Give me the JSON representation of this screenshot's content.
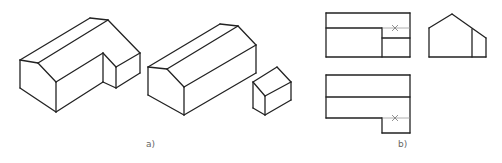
{
  "figure": {
    "background": "#ffffff",
    "line_color": "#222222",
    "hidden_line_color": "#9a9a9a",
    "labels": {
      "a": "a)",
      "b": "b)"
    },
    "part_a": {
      "caption": "a)",
      "description": "Isometric views: L-shaped gabled house, and the same house decomposed into a gabled main body plus a small gabled annex",
      "l_house": [
        [
          20,
          60,
          90,
          18
        ],
        [
          90,
          18,
          108,
          20
        ],
        [
          108,
          20,
          140,
          53
        ],
        [
          20,
          60,
          38,
          63
        ],
        [
          38,
          63,
          108,
          20
        ],
        [
          38,
          63,
          56,
          82
        ],
        [
          20,
          60,
          20,
          88
        ],
        [
          20,
          88,
          56,
          112
        ],
        [
          56,
          82,
          56,
          112
        ],
        [
          56,
          82,
          103,
          53
        ],
        [
          56,
          112,
          103,
          82
        ],
        [
          103,
          53,
          103,
          82
        ],
        [
          103,
          53,
          116,
          67
        ],
        [
          103,
          82,
          116,
          88
        ],
        [
          116,
          67,
          116,
          88
        ],
        [
          116,
          67,
          140,
          53
        ],
        [
          116,
          88,
          140,
          73
        ],
        [
          140,
          53,
          140,
          73
        ]
      ],
      "main_body": [
        [
          148,
          67,
          220,
          24
        ],
        [
          220,
          24,
          238,
          26
        ],
        [
          238,
          26,
          256,
          45
        ],
        [
          148,
          67,
          167,
          69
        ],
        [
          167,
          69,
          238,
          26
        ],
        [
          167,
          69,
          184,
          87
        ],
        [
          148,
          67,
          148,
          95
        ],
        [
          148,
          95,
          184,
          115
        ],
        [
          184,
          87,
          184,
          115
        ],
        [
          184,
          87,
          256,
          45
        ],
        [
          184,
          115,
          256,
          73
        ],
        [
          256,
          45,
          256,
          73
        ]
      ],
      "annex": [
        [
          253,
          82,
          277,
          67
        ],
        [
          277,
          67,
          291,
          82
        ],
        [
          253,
          82,
          265,
          96
        ],
        [
          265,
          96,
          291,
          82
        ],
        [
          253,
          82,
          253,
          108
        ],
        [
          265,
          96,
          265,
          115
        ],
        [
          291,
          82,
          291,
          100
        ],
        [
          253,
          108,
          265,
          115
        ],
        [
          265,
          115,
          291,
          100
        ]
      ]
    },
    "part_b": {
      "caption": "b)",
      "description": "Orthographic projections: front view, side view, top view",
      "front_view": {
        "lines": [
          [
            326,
            13,
            410,
            13
          ],
          [
            326,
            13,
            326,
            57
          ],
          [
            410,
            13,
            410,
            57
          ],
          [
            326,
            57,
            410,
            57
          ],
          [
            326,
            28,
            382,
            28
          ],
          [
            382,
            28,
            382,
            57
          ],
          [
            382,
            38,
            410,
            38
          ]
        ],
        "hidden_lines": [
          [
            382,
            28,
            410,
            28
          ]
        ],
        "cross_marks": [
          [
            395,
            28
          ]
        ]
      },
      "side_view": {
        "lines": [
          [
            429,
            28,
            452,
            14
          ],
          [
            452,
            14,
            486,
            38
          ],
          [
            429,
            28,
            429,
            57
          ],
          [
            486,
            38,
            486,
            57
          ],
          [
            429,
            57,
            486,
            57
          ],
          [
            472,
            29,
            472,
            57
          ]
        ]
      },
      "top_view": {
        "lines": [
          [
            326,
            75,
            410,
            75
          ],
          [
            326,
            75,
            326,
            118
          ],
          [
            410,
            75,
            410,
            133
          ],
          [
            326,
            97,
            410,
            97
          ],
          [
            326,
            118,
            382,
            118
          ],
          [
            382,
            118,
            382,
            133
          ],
          [
            382,
            133,
            410,
            133
          ]
        ],
        "hidden_lines": [
          [
            382,
            118,
            410,
            118
          ]
        ],
        "cross_marks": [
          [
            395,
            118
          ]
        ]
      }
    }
  }
}
